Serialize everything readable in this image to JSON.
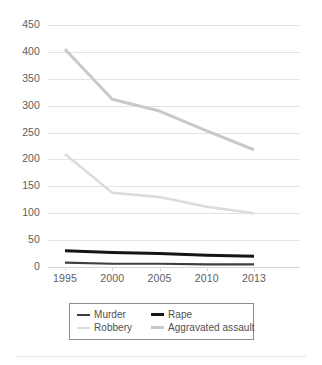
{
  "chart_data": {
    "type": "line",
    "title": "",
    "subtitle": "",
    "xlabel": "",
    "ylabel": "",
    "categories": [
      "1995",
      "2000",
      "2005",
      "2010",
      "2013"
    ],
    "ylim": [
      0,
      450
    ],
    "ytick_step": 50,
    "yticks": [
      "450",
      "400",
      "350",
      "300",
      "250",
      "200",
      "150",
      "100",
      "50",
      "0"
    ],
    "grid": true,
    "legend_position": "bottom",
    "series": [
      {
        "name": "Murder",
        "color": "#3f3f3f",
        "width": 2.2,
        "values": [
          8,
          6,
          6,
          5,
          5
        ]
      },
      {
        "name": "Rape",
        "color": "#151515",
        "width": 3.0,
        "values": [
          30,
          27,
          25,
          22,
          20
        ]
      },
      {
        "name": "Robbery",
        "color": "#dcdcdc",
        "width": 2.6,
        "values": [
          210,
          138,
          130,
          112,
          100
        ]
      },
      {
        "name": "Aggravated assault",
        "color": "#c9c9c9",
        "width": 3.0,
        "values": [
          405,
          312,
          290,
          253,
          218
        ]
      }
    ]
  },
  "legend": {
    "entries": [
      {
        "label": "Murder",
        "color": "#3f3f3f",
        "thickness": "2px"
      },
      {
        "label": "Rape",
        "color": "#151515",
        "thickness": "3px"
      },
      {
        "label": "Robbery",
        "color": "#dcdcdc",
        "thickness": "2px"
      },
      {
        "label": "Aggravated assault",
        "color": "#c9c9c9",
        "thickness": "3px"
      }
    ]
  },
  "colors": {
    "gridline": "#e3e3e3",
    "tick_text": "#5d5d5f",
    "legend_border": "#8c8c8c",
    "background": "#ffffff"
  }
}
